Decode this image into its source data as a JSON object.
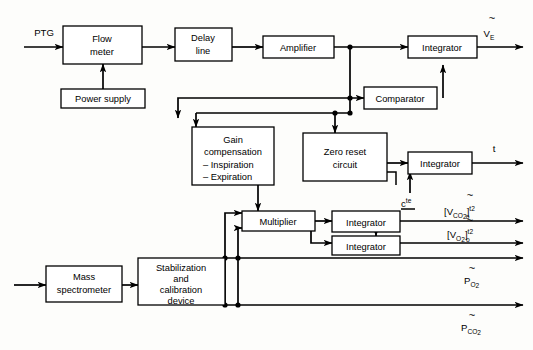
{
  "diagram": {
    "blocks": [
      {
        "id": "flow_meter",
        "label_lines": [
          "Flow",
          "meter"
        ]
      },
      {
        "id": "power_supply",
        "label_lines": [
          "Power supply"
        ]
      },
      {
        "id": "delay_line",
        "label_lines": [
          "Delay",
          "line"
        ]
      },
      {
        "id": "amplifier",
        "label_lines": [
          "Amplifier"
        ]
      },
      {
        "id": "integrator_ve",
        "label_lines": [
          "Integrator"
        ]
      },
      {
        "id": "comparator",
        "label_lines": [
          "Comparator"
        ]
      },
      {
        "id": "gain_comp",
        "label_lines": [
          "Gain",
          "compensation",
          "– Inspiration",
          "– Expiration"
        ]
      },
      {
        "id": "zero_reset",
        "label_lines": [
          "Zero reset",
          "circuit"
        ]
      },
      {
        "id": "integrator_t",
        "label_lines": [
          "Integrator"
        ]
      },
      {
        "id": "multiplier",
        "label_lines": [
          "Multiplier"
        ]
      },
      {
        "id": "integrator_co2",
        "label_lines": [
          "Integrator"
        ]
      },
      {
        "id": "integrator_o2",
        "label_lines": [
          "Integrator"
        ]
      },
      {
        "id": "mass_spec",
        "label_lines": [
          "Mass",
          "spectrometer"
        ]
      },
      {
        "id": "stab_calib",
        "label_lines": [
          "Stabilization",
          "and",
          "calibration",
          "device"
        ]
      }
    ],
    "signals": {
      "input_ptg": "PTG",
      "output_ve": {
        "base": "V",
        "sub": "E",
        "overmark": "~"
      },
      "output_t": "t",
      "constant": {
        "base": "c",
        "sup": "te"
      },
      "output_vco2": {
        "bracket_open": "[",
        "base": "V",
        "sub": "CO",
        "sub2": "2",
        "bracket_close": "]",
        "limit_upper": "t2",
        "limit_lower": "o",
        "overmark": "~"
      },
      "output_vo2": {
        "bracket_open": "[",
        "base": "V",
        "sub": "O",
        "sub2": "2",
        "bracket_close": "]",
        "limit_upper": "t2",
        "limit_lower": "o",
        "overmark": "~"
      },
      "output_po2": {
        "base": "P",
        "sub": "O",
        "sub2": "2",
        "overmark": "~"
      },
      "output_pco2": {
        "base": "P",
        "sub": "CO",
        "sub2": "2",
        "overmark": "~"
      }
    },
    "colors": {
      "line": "#000000",
      "box_fill": "#ffffff",
      "background": "#fdfdfb"
    }
  }
}
